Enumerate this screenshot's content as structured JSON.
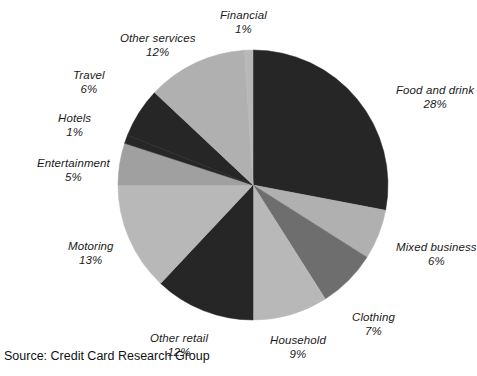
{
  "source_note": "Source: Credit Card Research Group",
  "chart_data": {
    "type": "pie",
    "title": "",
    "subtitle": "",
    "xlabel": "",
    "ylabel": "",
    "legend_position": "none",
    "grid": false,
    "start_angle_deg": 0,
    "direction": "clockwise",
    "units": "%",
    "center": {
      "x": 253,
      "y": 185
    },
    "radius": 135,
    "categories": [
      "Food and drink",
      "Mixed business",
      "Clothing",
      "Household",
      "Other retail",
      "Motoring",
      "Entertainment",
      "Hotels",
      "Travel",
      "Other services",
      "Financial"
    ],
    "values": [
      28,
      6,
      7,
      9,
      12,
      13,
      5,
      1,
      6,
      12,
      1
    ],
    "colors": [
      "#262626",
      "#b0b0b0",
      "#6e6e6e",
      "#b8b8b8",
      "#262626",
      "#b8b8b8",
      "#a0a0a0",
      "#262626",
      "#262626",
      "#b0b0b0",
      "#b8b8b8"
    ],
    "slices": [
      {
        "name": "Food and drink",
        "value": 28,
        "pct_label": "28%",
        "color": "#262626",
        "label_x": 396,
        "label_y": 84,
        "anchor": "left"
      },
      {
        "name": "Mixed business",
        "value": 6,
        "pct_label": "6%",
        "color": "#b0b0b0",
        "label_x": 396,
        "label_y": 241,
        "anchor": "left"
      },
      {
        "name": "Clothing",
        "value": 7,
        "pct_label": "7%",
        "color": "#6e6e6e",
        "label_x": 352,
        "label_y": 311,
        "anchor": "left"
      },
      {
        "name": "Household",
        "value": 9,
        "pct_label": "9%",
        "color": "#b8b8b8",
        "label_x": 270,
        "label_y": 334,
        "anchor": "left"
      },
      {
        "name": "Other retail",
        "value": 12,
        "pct_label": "12%",
        "color": "#262626",
        "label_x": 150,
        "label_y": 332,
        "anchor": "left"
      },
      {
        "name": "Motoring",
        "value": 13,
        "pct_label": "13%",
        "color": "#b8b8b8",
        "label_x": 68,
        "label_y": 240,
        "anchor": "left"
      },
      {
        "name": "Entertainment",
        "value": 5,
        "pct_label": "5%",
        "color": "#a0a0a0",
        "label_x": 37,
        "label_y": 157,
        "anchor": "left"
      },
      {
        "name": "Hotels",
        "value": 1,
        "pct_label": "1%",
        "color": "#262626",
        "label_x": 58,
        "label_y": 112,
        "anchor": "left"
      },
      {
        "name": "Travel",
        "value": 6,
        "pct_label": "6%",
        "color": "#262626",
        "label_x": 73,
        "label_y": 69,
        "anchor": "left"
      },
      {
        "name": "Other services",
        "value": 12,
        "pct_label": "12%",
        "color": "#b0b0b0",
        "label_x": 120,
        "label_y": 32,
        "anchor": "left"
      },
      {
        "name": "Financial",
        "value": 1,
        "pct_label": "1%",
        "color": "#b8b8b8",
        "label_x": 220,
        "label_y": 9,
        "anchor": "left"
      }
    ]
  }
}
